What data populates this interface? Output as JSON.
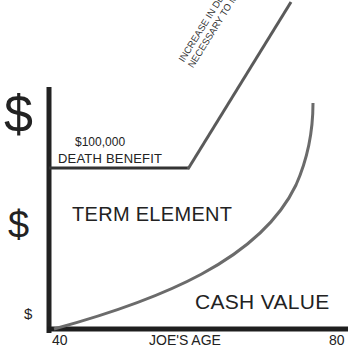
{
  "diagram": {
    "y_axis": {
      "markers": [
        "$",
        "$",
        "$"
      ]
    },
    "x_axis": {
      "min_label": "40",
      "label": "JOE'S AGE",
      "max_label": "80"
    },
    "death_benefit": {
      "amount": "$100,000",
      "label": "DEATH BENEFIT"
    },
    "corridor_annotation": {
      "line1": "INCREASE IN DEATH BENEFIT",
      "line2": "NECESSARY TO MAINTAIN CORRIDOR"
    },
    "regions": {
      "term_element": "TERM ELEMENT",
      "cash_value": "CASH VALUE"
    },
    "colors": {
      "axis": "#222222",
      "benefit_line": "#333333",
      "curve": "#6b6b6b",
      "diagonal": "#5a5a5a"
    }
  }
}
